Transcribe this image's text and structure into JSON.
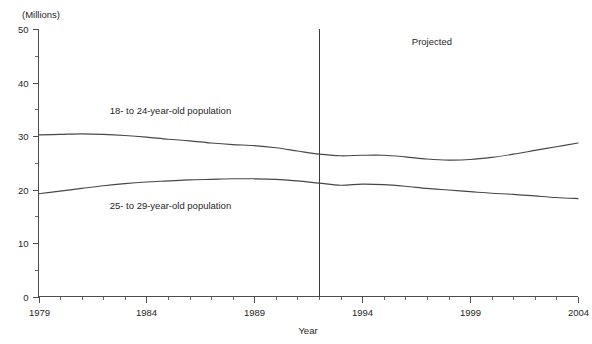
{
  "chart_data": {
    "type": "line",
    "title": "",
    "xlabel": "Year",
    "ylabel": "",
    "unit_label": "(Millions)",
    "xlim": [
      1979,
      2004
    ],
    "ylim": [
      0,
      50
    ],
    "grid": false,
    "legend_position": "inline-annotations",
    "x_ticks": [
      1979,
      1984,
      1989,
      1994,
      1999,
      2004
    ],
    "x_tick_labels": [
      "1979",
      "1984",
      "1989",
      "1994",
      "1999",
      "2004"
    ],
    "x_minor_tick_step": 1,
    "y_ticks": [
      0,
      10,
      20,
      30,
      40,
      50
    ],
    "y_tick_labels": [
      "0",
      "10",
      "20",
      "30",
      "40",
      "50"
    ],
    "y_minor_ticks": [
      5,
      15,
      25,
      35,
      45
    ],
    "x": [
      1979,
      1980,
      1981,
      1982,
      1983,
      1984,
      1985,
      1986,
      1987,
      1988,
      1989,
      1990,
      1991,
      1992,
      1993,
      1994,
      1995,
      1996,
      1997,
      1998,
      1999,
      2000,
      2001,
      2002,
      2003,
      2004
    ],
    "series": [
      {
        "name": "18- to 24-year-old population",
        "values": [
          30.2,
          30.3,
          30.4,
          30.3,
          30.1,
          29.8,
          29.4,
          29.1,
          28.7,
          28.4,
          28.2,
          27.8,
          27.2,
          26.6,
          26.3,
          26.4,
          26.4,
          26.1,
          25.7,
          25.5,
          25.6,
          26.0,
          26.6,
          27.3,
          28.0,
          28.7
        ],
        "annotation": "18- to 24-year-old population",
        "annotation_x": 1982.3,
        "annotation_y": 34.2
      },
      {
        "name": "25- to 29-year-old population",
        "values": [
          19.2,
          19.7,
          20.2,
          20.7,
          21.1,
          21.4,
          21.6,
          21.8,
          21.9,
          22.0,
          22.0,
          21.9,
          21.6,
          21.2,
          20.8,
          21.0,
          20.9,
          20.6,
          20.2,
          19.9,
          19.6,
          19.3,
          19.1,
          18.8,
          18.5,
          18.3
        ],
        "annotation": "25- to 29-year-old population",
        "annotation_x": 1982.3,
        "annotation_y": 16.4
      }
    ],
    "annotations": [
      {
        "text": "Projected",
        "x": 1996.3,
        "y": 47.0,
        "name": "projected-label"
      }
    ],
    "divider": {
      "x": 1992,
      "label": "projection-start-divider"
    }
  }
}
